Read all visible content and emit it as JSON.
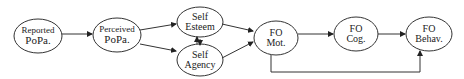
{
  "diagram": {
    "nodes": [
      {
        "id": "reported",
        "lines": [
          "Reported",
          "PoPa."
        ]
      },
      {
        "id": "perceived",
        "lines": [
          "Perceived",
          "PoPa."
        ]
      },
      {
        "id": "self_esteem",
        "lines": [
          "Self",
          "Esteem"
        ]
      },
      {
        "id": "self_agency",
        "lines": [
          "Self",
          "Agency"
        ]
      },
      {
        "id": "fo_mot",
        "lines": [
          "FO",
          "Mot."
        ]
      },
      {
        "id": "fo_cog",
        "lines": [
          "FO",
          "Cog."
        ]
      },
      {
        "id": "fo_behav",
        "lines": [
          "FO",
          "Behav."
        ]
      }
    ],
    "edges": [
      {
        "from": "reported",
        "to": "perceived"
      },
      {
        "from": "perceived",
        "to": "self_esteem"
      },
      {
        "from": "perceived",
        "to": "self_agency"
      },
      {
        "from": "self_esteem",
        "to": "self_agency",
        "bidirectional": true
      },
      {
        "from": "self_esteem",
        "to": "fo_mot"
      },
      {
        "from": "self_agency",
        "to": "fo_mot"
      },
      {
        "from": "fo_mot",
        "to": "fo_cog"
      },
      {
        "from": "fo_cog",
        "to": "fo_behav"
      },
      {
        "from": "fo_mot",
        "to": "fo_behav"
      }
    ]
  }
}
